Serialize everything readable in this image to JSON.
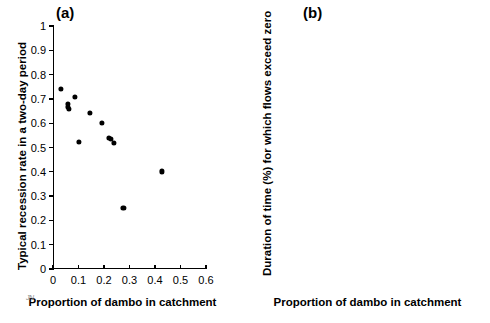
{
  "figure": {
    "panels": [
      {
        "tag": "(a)",
        "xlabel": "Proportion of dambo in catchment",
        "ylabel": "Typical recession rate in a two-day period",
        "xticks": [
          "0",
          "0.1",
          "0.2",
          "0.3",
          "0.4",
          "0.5",
          "0.6"
        ],
        "yticks": [
          "0",
          "0.1",
          "0.2",
          "0.3",
          "0.4",
          "0.5",
          "0.6",
          "0.7",
          "0.8",
          "0.9",
          "1"
        ]
      },
      {
        "tag": "(b)",
        "xlabel": "Proportion of dambo in catchment",
        "ylabel": "Duration of time (%) for which flows exceed zero",
        "xticks": [
          "0",
          "0.1",
          "0.2",
          "0.3",
          "0.4",
          "0.5",
          "0.6"
        ],
        "yticks": [
          "0",
          "10",
          "20",
          "30",
          "40",
          "50",
          "60",
          "70",
          "80",
          "90",
          "100"
        ]
      }
    ],
    "corner_mark": "JN",
    "marker_color": "#000000",
    "axis_color": "#000000",
    "background_color": "#ffffff"
  },
  "chart_data": [
    {
      "type": "scatter",
      "title": "(a)",
      "xlabel": "Proportion of dambo in catchment",
      "ylabel": "Typical recession rate in a two-day period",
      "xlim": [
        0,
        0.6
      ],
      "ylim": [
        0,
        1
      ],
      "xticks": [
        0,
        0.1,
        0.2,
        0.3,
        0.4,
        0.5,
        0.6
      ],
      "yticks": [
        0,
        0.1,
        0.2,
        0.3,
        0.4,
        0.5,
        0.6,
        0.7,
        0.8,
        0.9,
        1
      ],
      "grid": false,
      "legend": "none",
      "points": [
        {
          "x": 0.03,
          "y": 0.742
        },
        {
          "x": 0.057,
          "y": 0.678
        },
        {
          "x": 0.06,
          "y": 0.668
        },
        {
          "x": 0.063,
          "y": 0.66
        },
        {
          "x": 0.085,
          "y": 0.707
        },
        {
          "x": 0.103,
          "y": 0.524
        },
        {
          "x": 0.145,
          "y": 0.643
        },
        {
          "x": 0.193,
          "y": 0.601
        },
        {
          "x": 0.218,
          "y": 0.54
        },
        {
          "x": 0.226,
          "y": 0.535
        },
        {
          "x": 0.24,
          "y": 0.518
        },
        {
          "x": 0.276,
          "y": 0.252
        },
        {
          "x": 0.428,
          "y": 0.402
        }
      ]
    },
    {
      "type": "scatter",
      "title": "(b)",
      "xlabel": "Proportion of dambo in catchment",
      "ylabel": "Duration of time (%) for which flows exceed zero",
      "xlim": [
        0,
        0.6
      ],
      "ylim": [
        0,
        100
      ],
      "xticks": [
        0,
        0.1,
        0.2,
        0.3,
        0.4,
        0.5,
        0.6
      ],
      "yticks": [
        0,
        10,
        20,
        30,
        40,
        50,
        60,
        70,
        80,
        90,
        100
      ],
      "grid": false,
      "legend": "none",
      "points": [
        {
          "x": 0.03,
          "y": 100.0
        },
        {
          "x": 0.05,
          "y": 100.0
        },
        {
          "x": 0.057,
          "y": 97.0
        },
        {
          "x": 0.07,
          "y": 100.0
        },
        {
          "x": 0.085,
          "y": 100.0
        },
        {
          "x": 0.103,
          "y": 100.0
        },
        {
          "x": 0.145,
          "y": 92.3
        },
        {
          "x": 0.193,
          "y": 100.0
        },
        {
          "x": 0.218,
          "y": 76.2
        },
        {
          "x": 0.218,
          "y": 49.6
        },
        {
          "x": 0.24,
          "y": 49.6
        },
        {
          "x": 0.276,
          "y": 25.3
        },
        {
          "x": 0.428,
          "y": 49.6
        }
      ]
    }
  ]
}
